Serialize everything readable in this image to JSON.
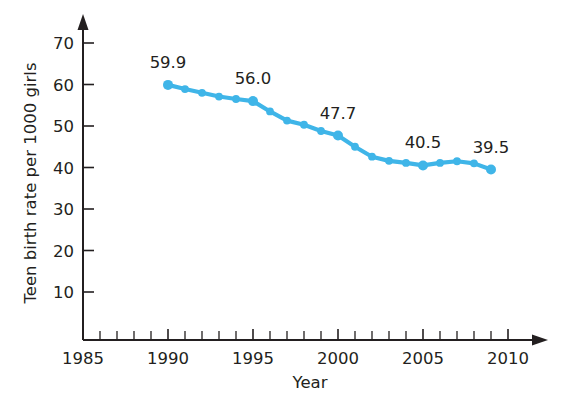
{
  "chart_data": {
    "type": "line",
    "title": "",
    "xlabel": "Year",
    "ylabel": "Teen birth rate per 1000 girls",
    "xlim": [
      1985,
      2010
    ],
    "ylim": [
      0,
      74
    ],
    "grid": false,
    "legend": null,
    "line_color": "#3FB5E8",
    "point_color": "#3FB5E8",
    "axis_color": "#231f20",
    "background_color": "#ffffff",
    "x_major_ticks": [
      1985,
      1990,
      1995,
      2000,
      2005,
      2010
    ],
    "x_major_tick_labels": [
      "1985",
      "1990",
      "1995",
      "2000",
      "2005",
      "2010"
    ],
    "x_minor_tick_step": 1,
    "y_major_ticks": [
      10,
      20,
      30,
      40,
      50,
      60,
      70
    ],
    "y_major_tick_labels": [
      "10",
      "20",
      "30",
      "40",
      "50",
      "60",
      "70"
    ],
    "x": [
      1990,
      1991,
      1992,
      1993,
      1994,
      1995,
      1996,
      1997,
      1998,
      1999,
      2000,
      2001,
      2002,
      2003,
      2004,
      2005,
      2006,
      2007,
      2008,
      2009
    ],
    "values": [
      59.9,
      58.9,
      58.0,
      57.1,
      56.5,
      56.0,
      53.5,
      51.3,
      50.3,
      48.8,
      47.7,
      45.0,
      42.6,
      41.6,
      41.1,
      40.5,
      41.1,
      41.5,
      41.0,
      39.5
    ],
    "point_labels": [
      {
        "x": 1990,
        "value": 59.9,
        "text": "59.9"
      },
      {
        "x": 1995,
        "value": 56.0,
        "text": "56.0"
      },
      {
        "x": 2000,
        "value": 47.7,
        "text": "47.7"
      },
      {
        "x": 2005,
        "value": 40.5,
        "text": "40.5"
      },
      {
        "x": 2009,
        "value": 39.5,
        "text": "39.5"
      }
    ]
  }
}
